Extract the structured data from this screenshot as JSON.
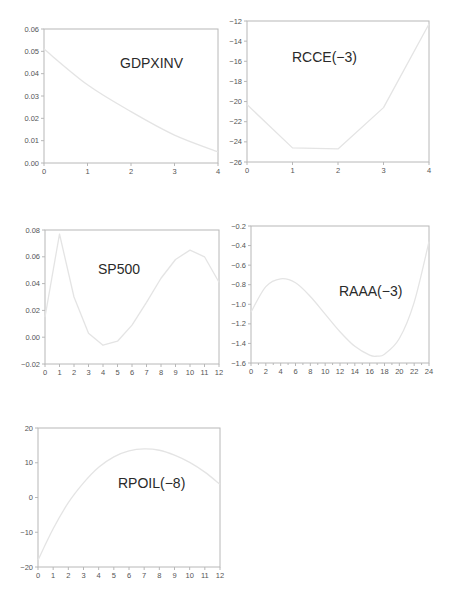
{
  "chart_data": [
    {
      "id": "gdpxinv",
      "type": "line",
      "title": "GDPXINV",
      "xlabel": "",
      "ylabel": "",
      "x": [
        0,
        1,
        2,
        3,
        4
      ],
      "values": [
        0.051,
        0.035,
        0.023,
        0.0125,
        0.005
      ],
      "xlim": [
        0,
        4
      ],
      "ylim": [
        0.0,
        0.06
      ],
      "xticks": [
        "0",
        "1",
        "2",
        "3",
        "4"
      ],
      "yticks": [
        "0.00",
        "0.01",
        "0.02",
        "0.03",
        "0.04",
        "0.05",
        "0.06"
      ],
      "grid": false,
      "smooth": true,
      "box": {
        "left": 44,
        "top": 29,
        "width": 174,
        "height": 134
      },
      "title_pos": {
        "x": 120,
        "y": 68
      }
    },
    {
      "id": "rcce",
      "type": "line",
      "title": "RCCE(−3)",
      "xlabel": "",
      "ylabel": "",
      "x": [
        0,
        1,
        2,
        3,
        4
      ],
      "values": [
        -20.3,
        -24.6,
        -24.7,
        -20.6,
        -12.3
      ],
      "xlim": [
        0,
        4
      ],
      "ylim": [
        -26,
        -12
      ],
      "xticks": [
        "0",
        "1",
        "2",
        "3",
        "4"
      ],
      "yticks": [
        "-26",
        "-24",
        "-22",
        "-20",
        "-18",
        "-16",
        "-14",
        "-12"
      ],
      "grid": false,
      "smooth": false,
      "box": {
        "left": 247,
        "top": 21,
        "width": 182,
        "height": 141
      },
      "title_pos": {
        "x": 292,
        "y": 62
      }
    },
    {
      "id": "sp500",
      "type": "line",
      "title": "SP500",
      "xlabel": "",
      "ylabel": "",
      "x": [
        0,
        1,
        2,
        3,
        4,
        5,
        6,
        7,
        8,
        9,
        10,
        11,
        12
      ],
      "values": [
        0.015,
        0.077,
        0.03,
        0.003,
        -0.006,
        -0.003,
        0.009,
        0.026,
        0.044,
        0.058,
        0.065,
        0.06,
        0.041
      ],
      "xlim": [
        0,
        12
      ],
      "ylim": [
        -0.02,
        0.08
      ],
      "xticks": [
        "0",
        "1",
        "2",
        "3",
        "4",
        "5",
        "6",
        "7",
        "8",
        "9",
        "10",
        "11",
        "12"
      ],
      "yticks": [
        "-0.02",
        "0.00",
        "0.02",
        "0.04",
        "0.06",
        "0.08"
      ],
      "grid": false,
      "smooth": false,
      "box": {
        "left": 45,
        "top": 230,
        "width": 174,
        "height": 134
      },
      "title_pos": {
        "x": 98,
        "y": 274
      }
    },
    {
      "id": "raaa",
      "type": "line",
      "title": "RAAA(−3)",
      "xlabel": "",
      "ylabel": "",
      "x": [
        0,
        2,
        4,
        6,
        8,
        10,
        12,
        14,
        16,
        17,
        18,
        20,
        22,
        24
      ],
      "values": [
        -1.08,
        -0.82,
        -0.74,
        -0.78,
        -0.92,
        -1.1,
        -1.28,
        -1.43,
        -1.52,
        -1.53,
        -1.51,
        -1.35,
        -0.98,
        -0.36
      ],
      "xlim": [
        0,
        24
      ],
      "ylim": [
        -1.6,
        -0.2
      ],
      "xticks": [
        "0",
        "2",
        "4",
        "6",
        "8",
        "10",
        "12",
        "14",
        "16",
        "18",
        "20",
        "22",
        "24"
      ],
      "yticks": [
        "-1.6",
        "-1.4",
        "-1.2",
        "-1.0",
        "-0.8",
        "-0.6",
        "-0.4",
        "-0.2"
      ],
      "grid": false,
      "smooth": true,
      "box": {
        "left": 251,
        "top": 226,
        "width": 178,
        "height": 137
      },
      "title_pos": {
        "x": 339,
        "y": 296
      }
    },
    {
      "id": "rpoil",
      "type": "line",
      "title": "RPOIL(−8)",
      "xlabel": "",
      "ylabel": "",
      "x": [
        0,
        1,
        2,
        3,
        4,
        5,
        6,
        7,
        8,
        9,
        10,
        11,
        12
      ],
      "values": [
        -18,
        -9,
        -1.5,
        4.2,
        8.7,
        11.7,
        13.4,
        14.0,
        13.6,
        12.2,
        10.1,
        7.3,
        3.8
      ],
      "xlim": [
        0,
        12
      ],
      "ylim": [
        -20,
        20
      ],
      "xticks": [
        "0",
        "1",
        "2",
        "3",
        "4",
        "5",
        "6",
        "7",
        "8",
        "9",
        "10",
        "11",
        "12"
      ],
      "yticks": [
        "-20",
        "-10",
        "0",
        "10",
        "20"
      ],
      "grid": false,
      "smooth": true,
      "box": {
        "left": 38,
        "top": 428,
        "width": 182,
        "height": 139
      },
      "title_pos": {
        "x": 118,
        "y": 488
      }
    }
  ],
  "colors": {
    "frame": "#b8b8b8",
    "series": "#e4e4e4",
    "ticklabel": "#555555",
    "title": "#2a2a2a",
    "background": "#ffffff"
  }
}
